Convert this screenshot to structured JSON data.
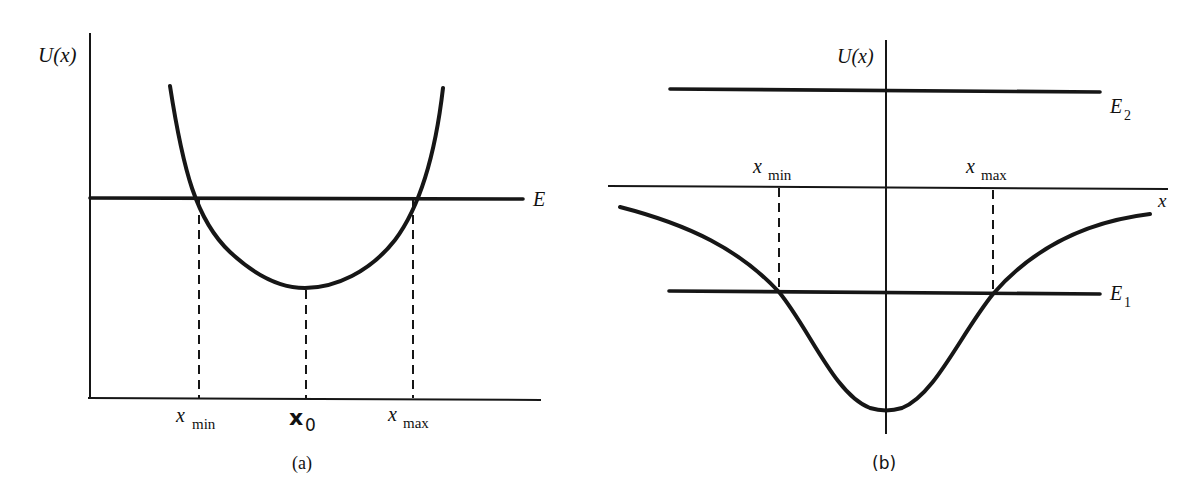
{
  "figure": {
    "panel_a": {
      "caption": "(a)",
      "y_axis_label": "U(x)",
      "energy_label": "E",
      "tick_labels": {
        "xmin_main": "x",
        "xmin_sub": "min",
        "x0_main": "x",
        "x0_sub": "0",
        "xmax_main": "x",
        "xmax_sub": "max"
      },
      "description": "Parabolic potential well U(x) with minimum at x0; horizontal energy line E intersects the curve at turning points x_min and x_max"
    },
    "panel_b": {
      "caption": "(b)",
      "y_axis_label": "U(x)",
      "x_axis_label": "x",
      "energy_labels": {
        "e2_main": "E",
        "e2_sub": "2",
        "e1_main": "E",
        "e1_sub": "1"
      },
      "tick_labels": {
        "xmin_main": "x",
        "xmin_sub": "min",
        "xmax_main": "x",
        "xmax_sub": "max"
      },
      "description": "Finite attractive potential well that approaches zero asymptotically; bound energy E1 < 0 intersects the curve at x_min and x_max; unbound energy E2 > 0 lies entirely above the curve"
    }
  }
}
